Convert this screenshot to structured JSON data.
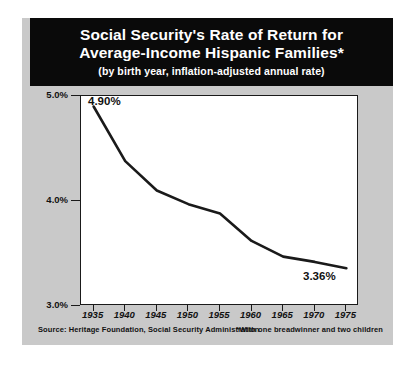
{
  "title": {
    "line1": "Social Security's Rate of Return for",
    "line2": "Average-Income Hispanic Families*",
    "subtitle": "(by birth year, inflation-adjusted annual rate)"
  },
  "source": "Source:  Heritage Foundation, Social Security Administration",
  "footnote": "*With one breadwinner and two children",
  "labels": {
    "start_value": "4.90%",
    "end_value": "3.36%"
  },
  "colors": {
    "title_bar": "#0a0a0a",
    "panel": "#c9c9c9",
    "plot_bg": "#ffffff",
    "line": "#1a1a1a",
    "text": "#111111"
  },
  "chart_data": {
    "type": "line",
    "title": "Social Security's Rate of Return for Average-Income Hispanic Families*",
    "subtitle": "(by birth year, inflation-adjusted annual rate)",
    "xlabel": "",
    "ylabel": "",
    "x": [
      1935,
      1940,
      1945,
      1950,
      1955,
      1960,
      1965,
      1970,
      1975
    ],
    "values": [
      4.9,
      4.38,
      4.1,
      3.97,
      3.88,
      3.62,
      3.47,
      3.42,
      3.36
    ],
    "xtick_labels": [
      "1935",
      "1940",
      "1945",
      "1950",
      "1955",
      "1960",
      "1965",
      "1970",
      "1975"
    ],
    "ytick_values": [
      3.0,
      4.0,
      5.0
    ],
    "ytick_labels": [
      "3.0%",
      "4.0%",
      "5.0%"
    ],
    "xlim": [
      1933,
      1977
    ],
    "ylim": [
      3.0,
      5.0
    ],
    "grid": false,
    "legend": "none",
    "annotations": [
      {
        "text": "4.90%",
        "x": 1935,
        "y": 4.9
      },
      {
        "text": "3.36%",
        "x": 1975,
        "y": 3.36
      }
    ]
  }
}
